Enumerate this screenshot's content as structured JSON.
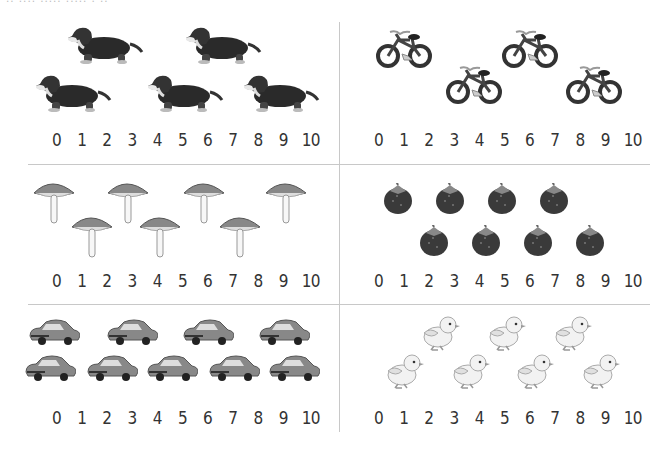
{
  "header": {
    "partial_text": "․․ ․․․․   ․․․․․ ․․․․․ ․ ․․"
  },
  "number_line": [
    "0",
    "1",
    "2",
    "3",
    "4",
    "5",
    "6",
    "7",
    "8",
    "9",
    "10"
  ],
  "panels": [
    {
      "id": "dogs",
      "object": "dachshund",
      "count": 5,
      "icon": "dog-icon"
    },
    {
      "id": "bicycles",
      "object": "bicycle",
      "count": 4,
      "icon": "bicycle-icon"
    },
    {
      "id": "mushrooms",
      "object": "mushroom",
      "count": 7,
      "icon": "mushroom-icon"
    },
    {
      "id": "strawberries",
      "object": "strawberry",
      "count": 8,
      "icon": "strawberry-icon"
    },
    {
      "id": "cars",
      "object": "car",
      "count": 9,
      "icon": "car-icon"
    },
    {
      "id": "chicks",
      "object": "chick",
      "count": 7,
      "icon": "chick-icon"
    }
  ],
  "colors": {
    "divider": "#c8c8c8",
    "number_text": "#333333"
  }
}
